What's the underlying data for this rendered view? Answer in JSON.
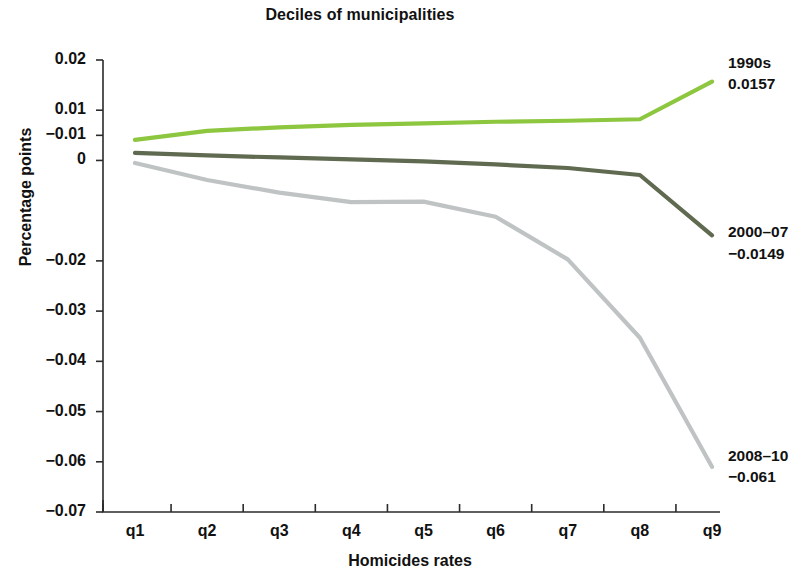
{
  "chart_data": {
    "type": "line",
    "title": "Deciles of municipalities",
    "xlabel": "Homicides rates",
    "ylabel": "Percentage points",
    "grid": false,
    "legend_position": "right-inline-annotations",
    "categories": [
      "q1",
      "q2",
      "q3",
      "q4",
      "q5",
      "q6",
      "q7",
      "q8",
      "q9"
    ],
    "x_tick_labels": [
      "q1",
      "q2",
      "q3",
      "q4",
      "q5",
      "q6",
      "q7",
      "q8",
      "q9"
    ],
    "y_tick_labels": [
      "0.02",
      "0.01",
      "−0.01",
      "0",
      "−0.02",
      "−0.03",
      "−0.04",
      "−0.05",
      "−0.06",
      "−0.07"
    ],
    "y_tick_values": [
      0.02,
      0.01,
      0.005,
      0,
      -0.02,
      -0.03,
      -0.04,
      -0.05,
      -0.06,
      -0.07
    ],
    "ylim": [
      -0.07,
      0.02
    ],
    "series": [
      {
        "name": "1990s",
        "color": "#8DC63F",
        "end_label": "1990s",
        "end_value": "0.0157",
        "values": [
          0.0041,
          0.0059,
          0.0066,
          0.0071,
          0.0074,
          0.0077,
          0.0079,
          0.0082,
          0.0157
        ]
      },
      {
        "name": "2000–07",
        "color": "#5F6A50",
        "end_label": "2000–07",
        "end_value": "−0.0149",
        "values": [
          0.0015,
          0.001,
          0.0006,
          0.0002,
          -0.0002,
          -0.0008,
          -0.0015,
          -0.0029,
          -0.0149
        ]
      },
      {
        "name": "2008–10",
        "color": "#BFC3C4",
        "end_label": "2008–10",
        "end_value": "−0.061",
        "values": [
          -0.0005,
          -0.0039,
          -0.0064,
          -0.0083,
          -0.0082,
          -0.0112,
          -0.0197,
          -0.0353,
          -0.061
        ]
      }
    ]
  },
  "annotations": {
    "s1": {
      "label": "1990s",
      "value": "0.0157"
    },
    "s2": {
      "label": "2000–07",
      "value": "−0.0149"
    },
    "s3": {
      "label": "2008–10",
      "value": "−0.061"
    }
  },
  "axes": {
    "title": "Deciles of municipalities",
    "ylabel": "Percentage points",
    "xlabel": "Homicides rates"
  }
}
